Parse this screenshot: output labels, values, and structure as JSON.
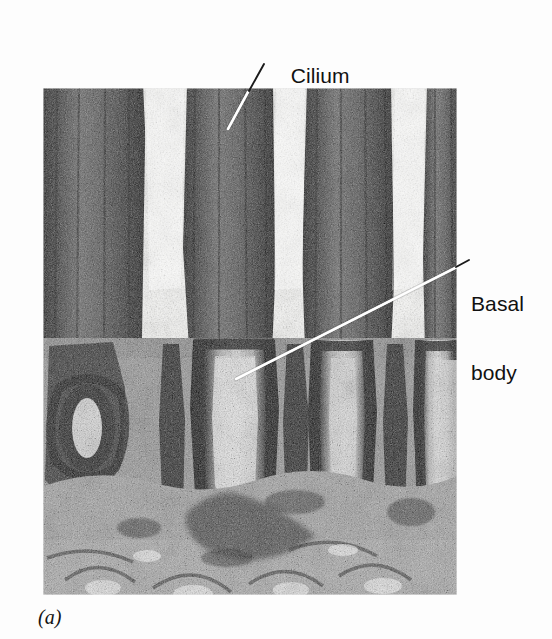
{
  "figure": {
    "caption": "(a)",
    "background_color": "#fdfdfd"
  },
  "micrograph": {
    "name": "cilia-basal-bodies-electron-micrograph",
    "x": 43,
    "y": 88,
    "width": 414,
    "height": 507,
    "tone_dark": "#1a1a1a",
    "tone_mid": "#6f6f6f",
    "tone_light": "#f2f2f2"
  },
  "annotations": [
    {
      "id": "cilium",
      "label": "Cilium",
      "label_x": 267,
      "label_y": 41,
      "leader_color": "#ffffff",
      "leader_outside": {
        "x1": 264,
        "y1": 63,
        "x2": 248,
        "y2": 92
      },
      "leader_inside": {
        "x1": 205,
        "y1": 4,
        "x2": 185,
        "y2": 41
      }
    },
    {
      "id": "basal-body",
      "label_line_1": "Basal",
      "label_line_2": "body",
      "label_x": 471,
      "label_y": 246,
      "leader_color": "#ffffff",
      "leader_outside": {
        "x1": 468,
        "y1": 261,
        "x2": 457,
        "y2": 267
      },
      "leader_inside": {
        "x1": 414,
        "y1": 179,
        "x2": 193,
        "y2": 291
      }
    }
  ],
  "colors": {
    "page_background": "#fdfdfd",
    "label_text": "#111111",
    "caption_text": "#141414",
    "leader_line": "#ffffff"
  }
}
